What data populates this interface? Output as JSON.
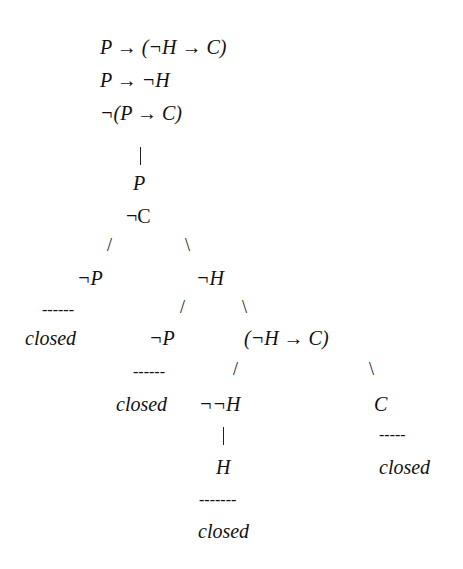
{
  "premises": [
    "P → (¬H → C)",
    "P → ¬H",
    "¬(P → C)"
  ],
  "nodes": {
    "p": "P",
    "not_c": "¬C",
    "left_not_p": "¬P",
    "not_h": "¬H",
    "mid_not_p": "¬P",
    "cond": "(¬H → C)",
    "dbl_not_h": "¬¬H",
    "c": "C",
    "h": "H"
  },
  "closed": {
    "label": "closed",
    "marks": [
      "------",
      "------",
      "-------",
      "-----"
    ]
  },
  "branches": {
    "vertical": "|",
    "left": "/",
    "right": "\\"
  }
}
